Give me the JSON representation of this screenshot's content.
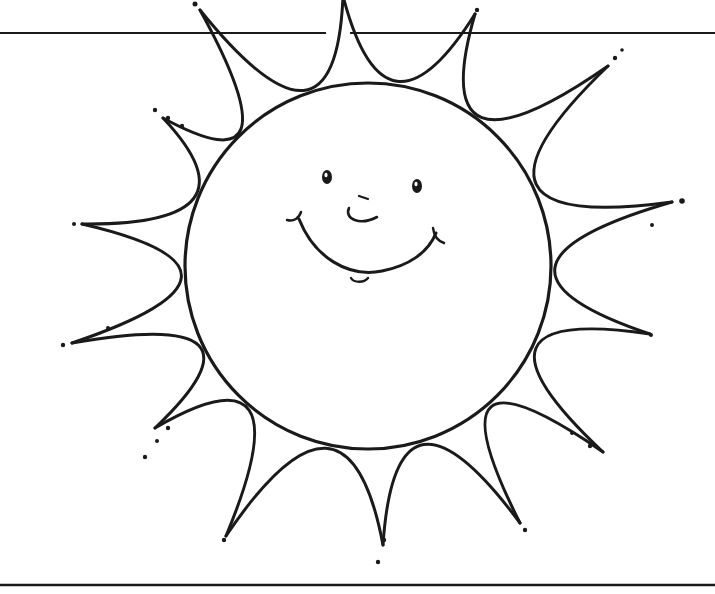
{
  "title": "Smiling sun coloring page",
  "colors": {
    "ink": "#1a1a1a",
    "paper": "#ffffff"
  },
  "illustration": {
    "subject": "sun-with-smiling-face",
    "frame_lines": {
      "top_y": 33,
      "bottom_y": 585
    },
    "sun": {
      "cx": 368,
      "cy": 266,
      "r": 183
    },
    "rays": [
      {
        "x": 200,
        "y": 10
      },
      {
        "x": 343,
        "y": -4
      },
      {
        "x": 475,
        "y": 14
      },
      {
        "x": 608,
        "y": 66
      },
      {
        "x": 672,
        "y": 202
      },
      {
        "x": 650,
        "y": 334
      },
      {
        "x": 603,
        "y": 452
      },
      {
        "x": 520,
        "y": 523
      },
      {
        "x": 383,
        "y": 545
      },
      {
        "x": 226,
        "y": 536
      },
      {
        "x": 155,
        "y": 428
      },
      {
        "x": 72,
        "y": 343
      },
      {
        "x": 82,
        "y": 224
      },
      {
        "x": 163,
        "y": 118
      }
    ],
    "dots": [
      {
        "x": 195,
        "y": 4,
        "r": 2.5
      },
      {
        "x": 477,
        "y": 10,
        "r": 2.2
      },
      {
        "x": 622,
        "y": 50,
        "r": 1.8
      },
      {
        "x": 615,
        "y": 58,
        "r": 2.2
      },
      {
        "x": 682,
        "y": 201,
        "r": 2.8
      },
      {
        "x": 652,
        "y": 225,
        "r": 2.0
      },
      {
        "x": 651,
        "y": 335,
        "r": 2.0
      },
      {
        "x": 155,
        "y": 110,
        "r": 2.2
      },
      {
        "x": 168,
        "y": 118,
        "r": 2.2
      },
      {
        "x": 182,
        "y": 126,
        "r": 2.2
      },
      {
        "x": 74,
        "y": 224,
        "r": 2.0
      },
      {
        "x": 108,
        "y": 328,
        "r": 2.0
      },
      {
        "x": 63,
        "y": 345,
        "r": 2.2
      },
      {
        "x": 168,
        "y": 428,
        "r": 2.2
      },
      {
        "x": 157,
        "y": 441,
        "r": 2.0
      },
      {
        "x": 145,
        "y": 457,
        "r": 2.2
      },
      {
        "x": 572,
        "y": 433,
        "r": 2.0
      },
      {
        "x": 590,
        "y": 446,
        "r": 2.2
      },
      {
        "x": 224,
        "y": 540,
        "r": 2.2
      },
      {
        "x": 384,
        "y": 540,
        "r": 2.2
      },
      {
        "x": 378,
        "y": 562,
        "r": 2.2
      },
      {
        "x": 525,
        "y": 530,
        "r": 2.2
      }
    ],
    "face": {
      "left_eye": {
        "cx": 327,
        "cy": 177,
        "rx": 5,
        "ry": 7
      },
      "right_eye": {
        "cx": 417,
        "cy": 186,
        "rx": 5,
        "ry": 7
      },
      "nose": "M 349 208 C 344 219, 360 226, 377 217",
      "nose_tick": "M 359 196 L 368 199",
      "smile": "M 299 219 C 314 257, 348 278, 382 271 C 408 266, 428 253, 436 233",
      "left_dimple": "M 287 220 C 294 222, 299 218, 301 212",
      "right_dimple": "M 433 228 C 434 236, 438 241, 444 243",
      "chin": "M 351 278 C 354 283, 364 283, 368 278"
    }
  }
}
